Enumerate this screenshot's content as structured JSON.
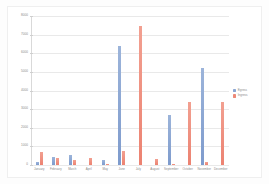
{
  "chart_data": {
    "type": "bar",
    "title": "",
    "xlabel": "",
    "ylabel": "",
    "ylim": [
      0,
      8000
    ],
    "ytick_step": 1000,
    "yticks": [
      "8000",
      "7000",
      "6000",
      "5000",
      "4000",
      "3000",
      "2000",
      "1000",
      "0"
    ],
    "grid": true,
    "legend_position": "right",
    "categories": [
      "January",
      "February",
      "March",
      "April",
      "May",
      "June",
      "July",
      "August",
      "September",
      "October",
      "November",
      "December"
    ],
    "series": [
      {
        "name": "Egress",
        "color": "#8aa6d3",
        "values": [
          180,
          450,
          560,
          0,
          250,
          6400,
          0,
          0,
          2700,
          0,
          5200,
          0
        ]
      },
      {
        "name": "Ingress",
        "color": "#ed8a78",
        "values": [
          700,
          400,
          250,
          350,
          40,
          760,
          7470,
          330,
          60,
          3400,
          170,
          3400
        ]
      }
    ]
  },
  "legend": {
    "items": [
      {
        "label": "Egress",
        "color": "#8aa6d3"
      },
      {
        "label": "Ingress",
        "color": "#ed8a78"
      }
    ]
  }
}
